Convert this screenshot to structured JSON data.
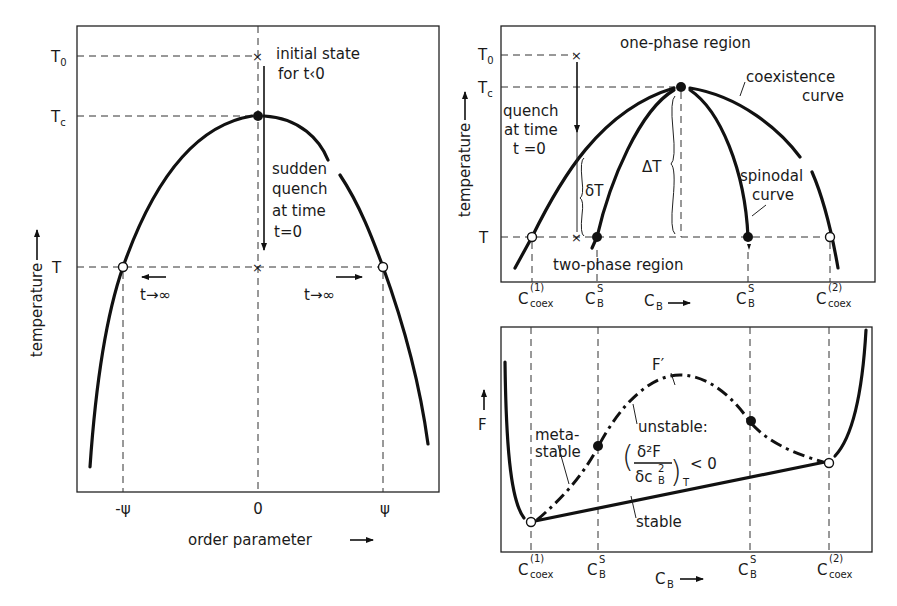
{
  "left_panel": {
    "y_axis_label": "temperature",
    "x_axis_label": "order parameter",
    "y_ticks": {
      "T0": "T",
      "T0_sub": "0",
      "Tc": "T",
      "Tc_sub": "c",
      "T": "T"
    },
    "x_ticks": [
      "-ψ",
      "0",
      "ψ"
    ],
    "annotations": {
      "initial_line1": "initial state",
      "initial_line2": "for t‹0",
      "quench_line1": "sudden",
      "quench_line2": "quench",
      "quench_line3": "at time",
      "quench_line4": "t=0",
      "t_inf_left": "t→∞",
      "t_inf_right": "t→∞"
    }
  },
  "top_right_panel": {
    "y_axis_label": "temperature",
    "y_ticks": {
      "T0": "T",
      "T0_sub": "0",
      "Tc": "T",
      "Tc_sub": "c",
      "T": "T"
    },
    "region_top": "one-phase region",
    "region_bottom": "two-phase region",
    "coexistence_line1": "coexistence",
    "coexistence_line2": "curve",
    "spinodal_line1": "spinodal",
    "spinodal_line2": "curve",
    "quench_line1": "quench",
    "quench_line2": "at time",
    "quench_line3": "t =0",
    "delta_small": "δT",
    "delta_big": "ΔT",
    "x_ticks": [
      {
        "main": "C",
        "sup": "(1)",
        "sub": "coex"
      },
      {
        "main": "C",
        "sup": "S",
        "sub": "B"
      },
      {
        "main": "C",
        "sup": "",
        "sub": "B",
        "arrow": true
      },
      {
        "main": "C",
        "sup": "S",
        "sub": "B"
      },
      {
        "main": "C",
        "sup": "(2)",
        "sub": "coex"
      }
    ]
  },
  "bottom_right_panel": {
    "y_axis_label": "F",
    "curve_label": "F′",
    "metastable_line1": "meta-",
    "metastable_line2": "stable",
    "unstable_label": "unstable:",
    "formula_num": "δ²F",
    "formula_den": "δc",
    "formula_den_sup": "2",
    "formula_den_sub": "B",
    "formula_sub": "T",
    "formula_rel": "< 0",
    "stable_label": "stable",
    "x_ticks": [
      {
        "main": "C",
        "sup": "(1)",
        "sub": "coex"
      },
      {
        "main": "C",
        "sup": "S",
        "sub": "B"
      },
      {
        "main": "C",
        "sup": "",
        "sub": "B",
        "arrow": true
      },
      {
        "main": "C",
        "sup": "S",
        "sub": "B"
      },
      {
        "main": "C",
        "sup": "(2)",
        "sub": "coex"
      }
    ]
  }
}
